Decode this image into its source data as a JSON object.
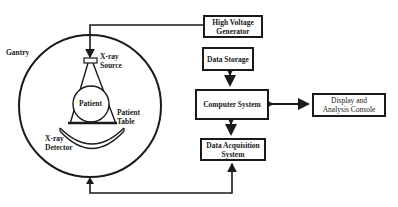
{
  "diagram": {
    "gantry": {
      "label": "Gantry",
      "xray_source_label_line1": "X-ray",
      "xray_source_label_line2": "Source",
      "patient_label": "Patient",
      "patient_table_label_line1": "Patient",
      "patient_table_label_line2": "Table",
      "xray_detector_label_line1": "X-ray",
      "xray_detector_label_line2": "Detector"
    },
    "boxes": {
      "high_voltage_generator": {
        "line1": "High Voltage",
        "line2": "Generator"
      },
      "data_storage": {
        "line1": "Data Storage"
      },
      "computer_system": {
        "line1": "Computer System"
      },
      "display_console": {
        "line1": "Display and",
        "line2": "Analysis Console"
      },
      "data_acquisition": {
        "line1": "Data Acquisition",
        "line2": "System"
      }
    },
    "connections": [
      {
        "from": "High Voltage Generator",
        "to": "X-ray Source",
        "direction": "one-way"
      },
      {
        "from": "Data Storage",
        "to": "Computer System",
        "direction": "two-way"
      },
      {
        "from": "Computer System",
        "to": "Display and Analysis Console",
        "direction": "two-way"
      },
      {
        "from": "Computer System",
        "to": "Data Acquisition System",
        "direction": "two-way"
      },
      {
        "from": "Gantry",
        "to": "Data Acquisition System",
        "direction": "two-way"
      }
    ],
    "colors": {
      "line": "#1a1a1a",
      "background": "#ffffff"
    }
  }
}
